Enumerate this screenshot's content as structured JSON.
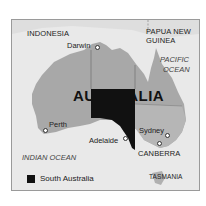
{
  "map": {
    "title": "AUSTRALIA",
    "highlighted_region": "South Australia",
    "labels": {
      "countries": [
        "INDONESIA",
        "PAPUA NEW GUINEA"
      ],
      "oceans": [
        "PACIFIC OCEAN",
        "INDIAN OCEAN"
      ],
      "island": "TASMANIA"
    },
    "cities": [
      {
        "name": "Darwin"
      },
      {
        "name": "Perth"
      },
      {
        "name": "Adelaide"
      },
      {
        "name": "Sydney"
      },
      {
        "name": "CANBERRA"
      }
    ],
    "colors": {
      "sea": "#e9e9e9",
      "land": "#a8a8a8",
      "highlight": "#111111",
      "neighbor_land": "#dadada"
    }
  },
  "labels": {
    "indonesia": "INDONESIA",
    "png_line1": "PAPUA NEW",
    "png_line2": "GUINEA",
    "pacific_line1": "PACIFIC",
    "pacific_line2": "OCEAN",
    "indian": "INDIAN OCEAN",
    "tasmania": "TASMANIA",
    "darwin": "Darwin",
    "perth": "Perth",
    "adelaide": "Adelaide",
    "sydney": "Sydney",
    "canberra": "CANBERRA",
    "title": "AUSTRALIA"
  },
  "legend": {
    "label": "South Australia"
  }
}
